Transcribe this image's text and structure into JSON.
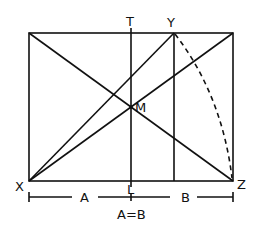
{
  "diagram": {
    "labels": {
      "T": "T",
      "Y": "Y",
      "M": "M",
      "X": "X",
      "Z": "Z",
      "L": "L",
      "A": "A",
      "B": "B",
      "equation": "A=B"
    },
    "colors": {
      "stroke": "#111111",
      "background": "#ffffff"
    }
  }
}
